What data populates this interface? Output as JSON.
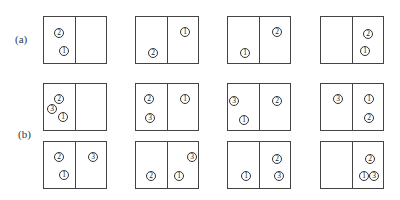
{
  "labels": {
    "a": "(a)",
    "b": "(b)"
  },
  "rows": [
    {
      "id": "a",
      "top": 16,
      "boxes": [
        {
          "left": 43,
          "markers": [
            {
              "n": "2",
              "x": 10,
              "y": 11
            },
            {
              "n": "1",
              "x": 15,
              "y": 29
            }
          ]
        },
        {
          "left": 135,
          "markers": [
            {
              "n": "2",
              "x": 12,
              "y": 31
            },
            {
              "n": "1",
              "x": 44,
              "y": 10
            }
          ]
        },
        {
          "left": 227,
          "markers": [
            {
              "n": "1",
              "x": 12,
              "y": 31
            },
            {
              "n": "2",
              "x": 44,
              "y": 10
            }
          ]
        },
        {
          "left": 320,
          "markers": [
            {
              "n": "2",
              "x": 42,
              "y": 12
            },
            {
              "n": "1",
              "x": 39,
              "y": 29
            }
          ]
        }
      ]
    },
    {
      "id": "b1",
      "top": 83,
      "boxes": [
        {
          "left": 43,
          "markers": [
            {
              "n": "2",
              "x": 10,
              "y": 10
            },
            {
              "n": "3",
              "x": 3,
              "y": 20
            },
            {
              "n": "1",
              "x": 14,
              "y": 28
            }
          ]
        },
        {
          "left": 135,
          "markers": [
            {
              "n": "2",
              "x": 8,
              "y": 10
            },
            {
              "n": "3",
              "x": 9,
              "y": 29
            },
            {
              "n": "1",
              "x": 44,
              "y": 10
            }
          ]
        },
        {
          "left": 227,
          "markers": [
            {
              "n": "3",
              "x": 1,
              "y": 12
            },
            {
              "n": "1",
              "x": 11,
              "y": 31
            },
            {
              "n": "2",
              "x": 44,
              "y": 12
            }
          ]
        },
        {
          "left": 320,
          "markers": [
            {
              "n": "3",
              "x": 12,
              "y": 10
            },
            {
              "n": "1",
              "x": 43,
              "y": 10
            },
            {
              "n": "2",
              "x": 43,
              "y": 29
            }
          ]
        }
      ]
    },
    {
      "id": "b2",
      "top": 141,
      "boxes": [
        {
          "left": 43,
          "markers": [
            {
              "n": "2",
              "x": 10,
              "y": 10
            },
            {
              "n": "1",
              "x": 15,
              "y": 28
            },
            {
              "n": "3",
              "x": 44,
              "y": 10
            }
          ]
        },
        {
          "left": 135,
          "markers": [
            {
              "n": "2",
              "x": 10,
              "y": 29
            },
            {
              "n": "1",
              "x": 38,
              "y": 29
            },
            {
              "n": "3",
              "x": 51,
              "y": 10
            }
          ]
        },
        {
          "left": 227,
          "markers": [
            {
              "n": "1",
              "x": 13,
              "y": 29
            },
            {
              "n": "2",
              "x": 44,
              "y": 12
            },
            {
              "n": "3",
              "x": 46,
              "y": 29
            }
          ]
        },
        {
          "left": 320,
          "markers": [
            {
              "n": "2",
              "x": 44,
              "y": 12
            },
            {
              "n": "1",
              "x": 38,
              "y": 29
            },
            {
              "n": "3",
              "x": 48,
              "y": 29
            }
          ]
        }
      ]
    }
  ],
  "glyphs": {
    "1": "1",
    "2": "2",
    "3": "3"
  }
}
